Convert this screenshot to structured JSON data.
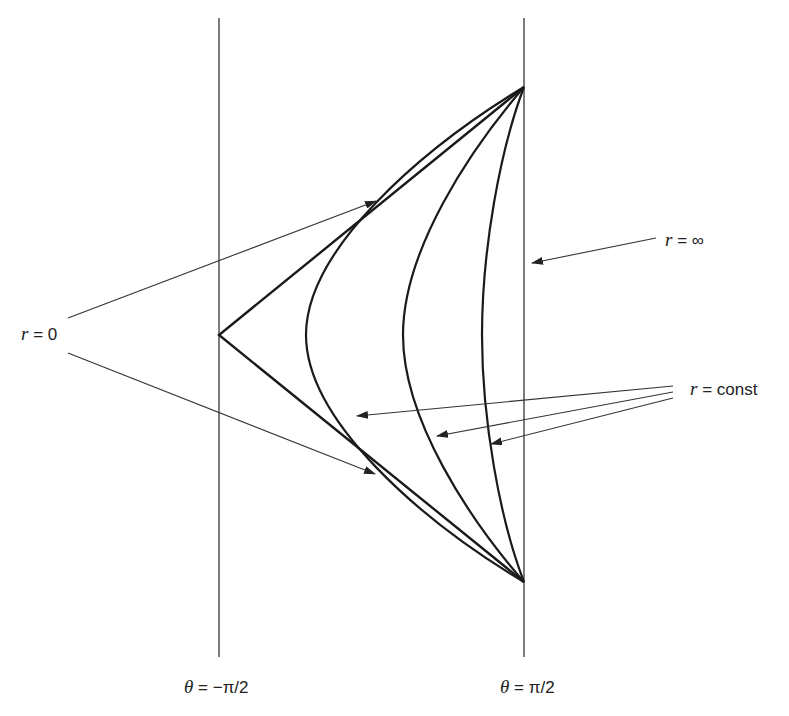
{
  "diagram": {
    "colors": {
      "ink": "#1a1a1a",
      "boundary": "#333333",
      "arrow": "#333333",
      "background": "#ffffff"
    },
    "labels": {
      "r_zero": {
        "var": "r",
        "rest": " = 0"
      },
      "r_infinity": {
        "var": "r",
        "rest": " = ∞"
      },
      "r_const": {
        "var": "r",
        "rest": " = const"
      },
      "theta_left": {
        "var": "θ",
        "rest": " = −π/2"
      },
      "theta_right": {
        "var": "θ",
        "rest": " = π/2"
      }
    },
    "boundaries": [
      {
        "name": "theta-minus-pi-over-2",
        "x": 219,
        "y1": 18,
        "y2": 657
      },
      {
        "name": "theta-pi-over-2",
        "x": 524,
        "y1": 18,
        "y2": 657
      }
    ],
    "vertices": {
      "top": [
        524,
        87
      ],
      "bottom": [
        524,
        582
      ],
      "left": [
        219,
        335
      ]
    },
    "curves": [
      {
        "name": "r-zero-wedge",
        "tip_x": 219
      },
      {
        "name": "r-const-1",
        "tip_x": 306
      },
      {
        "name": "r-const-2",
        "tip_x": 403
      },
      {
        "name": "r-const-3",
        "tip_x": 482
      }
    ]
  }
}
